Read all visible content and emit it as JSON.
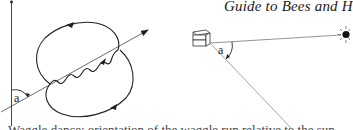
{
  "header": {
    "running_title": "Guide to Bees and H"
  },
  "figure": {
    "left_panel": {
      "description": "waggle dance figure-eight on vertical comb",
      "angle_label": "a",
      "elements": [
        "vertical-reference-line",
        "waggle-run-arrow",
        "return-loop-upper",
        "return-loop-lower"
      ]
    },
    "right_panel": {
      "description": "hive, sun direction and food source direction",
      "angle_label": "a",
      "elements": [
        "hive-icon",
        "sun-icon",
        "sun-direction-line",
        "food-direction-line"
      ]
    },
    "colors": {
      "ink": "#222222",
      "light_line": "#9a9a9a",
      "background": "#ffffff"
    }
  },
  "caption": {
    "partial_text": "Waggle dance: orientation of the waggle run relative to the sun"
  }
}
